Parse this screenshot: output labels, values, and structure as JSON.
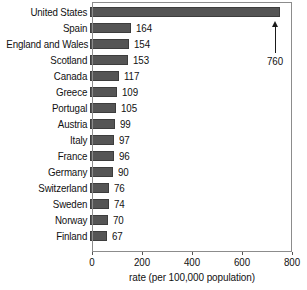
{
  "chart_data": {
    "type": "bar",
    "orientation": "horizontal",
    "title": "",
    "xlabel": "rate (per 100,000 population)",
    "ylabel": "",
    "xlim": [
      0,
      800
    ],
    "xticks": [
      0,
      200,
      400,
      600,
      800
    ],
    "xtick_labels": [
      "0",
      "200",
      "400",
      "600",
      "800"
    ],
    "grid": false,
    "legend": null,
    "bar_color": "#555555",
    "frame_color": "#8c8c8c",
    "categories": [
      "United States",
      "Spain",
      "England and Wales",
      "Scotland",
      "Canada",
      "Greece",
      "Portugal",
      "Austria",
      "Italy",
      "France",
      "Germany",
      "Switzerland",
      "Sweden",
      "Norway",
      "Finland"
    ],
    "values": [
      760,
      164,
      154,
      153,
      117,
      109,
      105,
      99,
      97,
      96,
      90,
      76,
      74,
      70,
      67
    ],
    "value_labels": [
      "",
      "164",
      "154",
      "153",
      "117",
      "109",
      "105",
      "99",
      "97",
      "96",
      "90",
      "76",
      "74",
      "70",
      "67"
    ],
    "annotations": [
      {
        "name": "united-states-callout",
        "text": "760",
        "points_to_category": "United States",
        "value": 760
      }
    ]
  },
  "rows": [
    {
      "label": "United States",
      "value": 760,
      "value_label": "",
      "show_value": false
    },
    {
      "label": "Spain",
      "value": 164,
      "value_label": "164",
      "show_value": true
    },
    {
      "label": "England and Wales",
      "value": 154,
      "value_label": "154",
      "show_value": true
    },
    {
      "label": "Scotland",
      "value": 153,
      "value_label": "153",
      "show_value": true
    },
    {
      "label": "Canada",
      "value": 117,
      "value_label": "117",
      "show_value": true
    },
    {
      "label": "Greece",
      "value": 109,
      "value_label": "109",
      "show_value": true
    },
    {
      "label": "Portugal",
      "value": 105,
      "value_label": "105",
      "show_value": true
    },
    {
      "label": "Austria",
      "value": 99,
      "value_label": "99",
      "show_value": true
    },
    {
      "label": "Italy",
      "value": 97,
      "value_label": "97",
      "show_value": true
    },
    {
      "label": "France",
      "value": 96,
      "value_label": "96",
      "show_value": true
    },
    {
      "label": "Germany",
      "value": 90,
      "value_label": "90",
      "show_value": true
    },
    {
      "label": "Switzerland",
      "value": 76,
      "value_label": "76",
      "show_value": true
    },
    {
      "label": "Sweden",
      "value": 74,
      "value_label": "74",
      "show_value": true
    },
    {
      "label": "Norway",
      "value": 70,
      "value_label": "70",
      "show_value": true
    },
    {
      "label": "Finland",
      "value": 67,
      "value_label": "67",
      "show_value": true
    }
  ],
  "axis": {
    "title": "rate (per 100,000 population)",
    "ticks": [
      "0",
      "200",
      "400",
      "600",
      "800"
    ]
  },
  "callout": {
    "text": "760"
  }
}
